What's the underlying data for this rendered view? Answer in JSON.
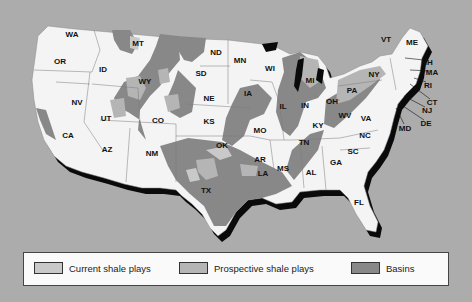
{
  "map": {
    "title": "",
    "colors": {
      "background": "#acacac",
      "land": "#f4f4f4",
      "shadow": "#0a0a0a",
      "border": "#777777",
      "current_shale_plays": "#c9c9c9",
      "prospective_shale_plays": "#b5b5b5",
      "basins": "#888888"
    },
    "states": [
      {
        "abbr": "WA",
        "x": 72,
        "y": 34
      },
      {
        "abbr": "OR",
        "x": 60,
        "y": 61
      },
      {
        "abbr": "ID",
        "x": 103,
        "y": 69
      },
      {
        "abbr": "MT",
        "x": 138,
        "y": 43
      },
      {
        "abbr": "ND",
        "x": 216,
        "y": 52
      },
      {
        "abbr": "MN",
        "x": 240,
        "y": 60
      },
      {
        "abbr": "WI",
        "x": 270,
        "y": 68
      },
      {
        "abbr": "MI",
        "x": 310,
        "y": 80
      },
      {
        "abbr": "NY",
        "x": 374,
        "y": 74
      },
      {
        "abbr": "VT",
        "x": 386,
        "y": 39
      },
      {
        "abbr": "ME",
        "x": 412,
        "y": 42
      },
      {
        "abbr": "PA",
        "x": 352,
        "y": 90
      },
      {
        "abbr": "OH",
        "x": 332,
        "y": 101
      },
      {
        "abbr": "IN",
        "x": 305,
        "y": 105
      },
      {
        "abbr": "IL",
        "x": 283,
        "y": 106
      },
      {
        "abbr": "IA",
        "x": 248,
        "y": 93
      },
      {
        "abbr": "NE",
        "x": 209,
        "y": 98
      },
      {
        "abbr": "SD",
        "x": 201,
        "y": 73
      },
      {
        "abbr": "WY",
        "x": 145,
        "y": 81
      },
      {
        "abbr": "NV",
        "x": 77,
        "y": 102
      },
      {
        "abbr": "UT",
        "x": 106,
        "y": 118
      },
      {
        "abbr": "CO",
        "x": 158,
        "y": 120
      },
      {
        "abbr": "KS",
        "x": 209,
        "y": 121
      },
      {
        "abbr": "MO",
        "x": 260,
        "y": 130
      },
      {
        "abbr": "KY",
        "x": 318,
        "y": 125
      },
      {
        "abbr": "WV",
        "x": 345,
        "y": 115
      },
      {
        "abbr": "VA",
        "x": 366,
        "y": 118
      },
      {
        "abbr": "NC",
        "x": 365,
        "y": 135
      },
      {
        "abbr": "TN",
        "x": 304,
        "y": 142
      },
      {
        "abbr": "OK",
        "x": 222,
        "y": 145
      },
      {
        "abbr": "AR",
        "x": 260,
        "y": 159
      },
      {
        "abbr": "MS",
        "x": 283,
        "y": 168
      },
      {
        "abbr": "AL",
        "x": 311,
        "y": 172
      },
      {
        "abbr": "GA",
        "x": 336,
        "y": 162
      },
      {
        "abbr": "SC",
        "x": 353,
        "y": 151
      },
      {
        "abbr": "LA",
        "x": 263,
        "y": 173
      },
      {
        "abbr": "TX",
        "x": 206,
        "y": 190
      },
      {
        "abbr": "NM",
        "x": 152,
        "y": 153
      },
      {
        "abbr": "AZ",
        "x": 107,
        "y": 149
      },
      {
        "abbr": "CA",
        "x": 68,
        "y": 135
      },
      {
        "abbr": "FL",
        "x": 359,
        "y": 202
      }
    ],
    "callout_states": [
      {
        "abbr": "NH",
        "x": 427,
        "y": 62
      },
      {
        "abbr": "MA",
        "x": 432,
        "y": 72
      },
      {
        "abbr": "RI",
        "x": 428,
        "y": 85
      },
      {
        "abbr": "CT",
        "x": 432,
        "y": 102
      },
      {
        "abbr": "NJ",
        "x": 427,
        "y": 110
      },
      {
        "abbr": "DE",
        "x": 426,
        "y": 123
      },
      {
        "abbr": "MD",
        "x": 405,
        "y": 128
      }
    ]
  },
  "legend": {
    "items": [
      {
        "label": "Current shale plays",
        "color": "#c9c9c9"
      },
      {
        "label": "Prospective shale plays",
        "color": "#b5b5b5"
      },
      {
        "label": "Basins",
        "color": "#888888"
      }
    ]
  }
}
